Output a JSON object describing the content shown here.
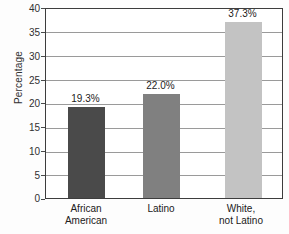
{
  "chart_data": {
    "type": "bar",
    "title": "",
    "xlabel": "",
    "ylabel": "Percentage",
    "categories": [
      "African American",
      "Latino",
      "White, not Latino"
    ],
    "category_lines": [
      [
        "African",
        "American"
      ],
      [
        "Latino",
        ""
      ],
      [
        "White,",
        "not Latino"
      ]
    ],
    "values": [
      19.3,
      22.0,
      37.3
    ],
    "value_labels": [
      "19.3%",
      "22.0%",
      "37.3%"
    ],
    "ylim": [
      0,
      40
    ],
    "yticks": [
      40,
      35,
      30,
      25,
      20,
      15,
      10,
      5,
      0
    ],
    "ytick_labels": [
      "40",
      "35",
      "30",
      "25",
      "20",
      "15",
      "10",
      "5",
      "0"
    ],
    "grid": true,
    "legend": "none",
    "bar_colors": [
      "#4a4a4a",
      "#808080",
      "#c3c3c3"
    ],
    "frame_color": "#3d3d3d",
    "gridline_color": "#9a9a9a",
    "background": "#ffffff"
  }
}
